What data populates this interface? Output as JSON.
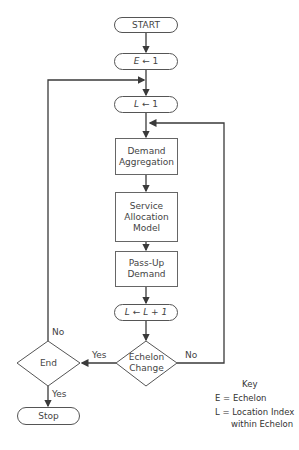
{
  "nodes": {
    "start": "START",
    "e_init_var": "E",
    "e_init_val": "← 1",
    "l_init_var": "L",
    "l_init_val": "← 1",
    "demand_aggregation_1": "Demand",
    "demand_aggregation_2": "Aggregation",
    "service_allocation_1": "Service",
    "service_allocation_2": "Allocation",
    "service_allocation_3": "Model",
    "pass_up_1": "Pass-Up",
    "pass_up_2": "Demand",
    "l_increment_var": "L",
    "l_increment_arrow": "←",
    "l_increment_expr": "L + 1",
    "echelon_change_1": "Echelon",
    "echelon_change_2": "Change",
    "end": "End",
    "stop": "Stop"
  },
  "edges": {
    "echelon_yes": "Yes",
    "echelon_no": "No",
    "end_no": "No",
    "end_yes": "Yes"
  },
  "key": {
    "title": "Key",
    "e_def": "E = Echelon",
    "l_def_1": "L = Location Index",
    "l_def_2": "within Echelon"
  },
  "colors": {
    "line": "#3a3a3a",
    "box_border": "#666666",
    "background": "#ffffff"
  }
}
